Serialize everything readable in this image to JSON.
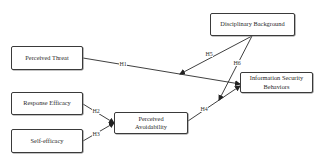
{
  "nodes": {
    "perceived_threat": "Perceived Threat",
    "disciplinary_background": "Disciplinary Background",
    "info_security_line1": "Information Security",
    "info_security_line2": "Behaviors",
    "response_efficacy": "Response Efficacy",
    "self_efficacy": "Self-efficacy",
    "perceived_avoid_line1": "Perceived",
    "perceived_avoid_line2": "Avoidability"
  },
  "hypotheses": {
    "h1": "H1",
    "h2": "H2",
    "h3": "H3",
    "h4": "H4",
    "h5": "H5",
    "h6": "H6"
  },
  "edges": [
    {
      "from": "Perceived Threat",
      "to": "Information Security Behaviors",
      "label": "H1"
    },
    {
      "from": "Response Efficacy",
      "to": "Perceived Avoidability",
      "label": "H2"
    },
    {
      "from": "Self-efficacy",
      "to": "Perceived Avoidability",
      "label": "H3"
    },
    {
      "from": "Perceived Avoidability",
      "to": "Information Security Behaviors",
      "label": "H4"
    },
    {
      "from": "Disciplinary Background",
      "to": "H1 path (moderation)",
      "label": "H5"
    },
    {
      "from": "Disciplinary Background",
      "to": "H4 path (moderation)",
      "label": "H6"
    }
  ],
  "colors": {
    "line": "#2a2a2a",
    "border": "#3a3a3a",
    "background": "#ffffff"
  }
}
